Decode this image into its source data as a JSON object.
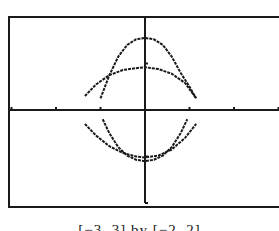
{
  "caption": "[−3, 3] by [−2, 2]",
  "colors": {
    "ink": "#1a1a1a",
    "background": "#ffffff"
  },
  "chart_data": {
    "type": "line",
    "title": "",
    "xlabel": "",
    "ylabel": "",
    "xlim": [
      -3,
      3
    ],
    "ylim": [
      -2,
      2
    ],
    "xtick_step": 1,
    "ytick_step": 1,
    "grid": false,
    "legend": null,
    "window_caption": "[−3, 3] by [−2, 2]",
    "series": [
      {
        "name": "narrow curve (upper branch)",
        "x": [
          -1.0,
          -0.8,
          -0.6,
          -0.4,
          -0.2,
          0,
          0.2,
          0.4,
          0.6,
          0.8,
          1.0,
          1.15
        ],
        "y": [
          0.25,
          0.75,
          1.15,
          1.4,
          1.52,
          1.55,
          1.52,
          1.4,
          1.15,
          0.8,
          0.5,
          0.25
        ]
      },
      {
        "name": "wide curve (upper branch)",
        "x": [
          -1.35,
          -1.1,
          -0.8,
          -0.5,
          -0.2,
          0,
          0.3,
          0.6,
          0.9,
          1.15
        ],
        "y": [
          0.3,
          0.55,
          0.75,
          0.86,
          0.9,
          0.92,
          0.88,
          0.78,
          0.58,
          0.25
        ]
      },
      {
        "name": "wide curve (lower branch)",
        "x": [
          -1.35,
          -1.1,
          -0.8,
          -0.5,
          -0.2,
          0,
          0.3,
          0.6,
          0.9,
          1.15
        ],
        "y": [
          -0.3,
          -0.55,
          -0.78,
          -0.92,
          -1.0,
          -1.02,
          -0.98,
          -0.85,
          -0.6,
          -0.3
        ]
      },
      {
        "name": "narrow curve (lower branch)",
        "x": [
          -0.95,
          -0.8,
          -0.6,
          -0.4,
          -0.2,
          0,
          0.2,
          0.4,
          0.6,
          0.8,
          0.95
        ],
        "y": [
          -0.2,
          -0.5,
          -0.8,
          -0.98,
          -1.07,
          -1.1,
          -1.07,
          -0.98,
          -0.8,
          -0.5,
          -0.2
        ]
      }
    ]
  }
}
